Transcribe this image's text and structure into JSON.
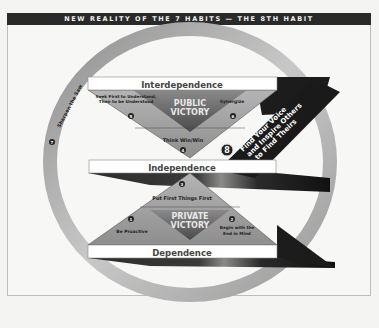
{
  "title": "NEW REALITY OF THE 7 HABITS — THE 8TH HABIT",
  "levels": {
    "interdependence": "Interdependence",
    "independence": "Independence",
    "dependence": "Dependence"
  },
  "victories": {
    "public": [
      "PUBLIC",
      "VICTORY"
    ],
    "private": [
      "PRIVATE",
      "VICTORY"
    ]
  },
  "habits": [
    {
      "number": "1",
      "label": "Be Proactive"
    },
    {
      "number": "2",
      "label": "Begin with the End in Mind",
      "lines": [
        "Begin with the",
        "End in Mind"
      ]
    },
    {
      "number": "3",
      "label": "Put First Things First"
    },
    {
      "number": "4",
      "label": "Think Win/Win"
    },
    {
      "number": "5",
      "label": "Seek First to Understand, Then to be Understood",
      "lines": [
        "Seek First to Understand,",
        "Then to be Understood"
      ]
    },
    {
      "number": "6",
      "label": "Synergize"
    },
    {
      "number": "7",
      "label": "Sharpen the Saw"
    },
    {
      "number": "8",
      "label": "Find Your Voice and Inspire Others to Find Theirs",
      "lines": [
        "Find Your Voice",
        "and Inspire Others",
        "to Find Theirs"
      ]
    }
  ],
  "colors": {
    "title_bar": "#2a2a2a",
    "ring": "#a8a8a8",
    "triangle": "#9a9a9a",
    "victory_diamond": "#6e6e6e",
    "band": "#1e1e1e",
    "banner": "#ffffff"
  }
}
